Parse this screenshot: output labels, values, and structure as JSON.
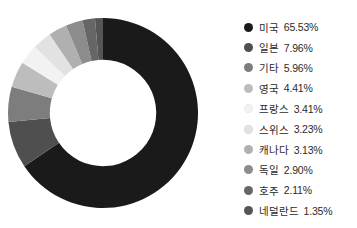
{
  "chart_data": {
    "type": "pie",
    "variant": "donut",
    "title": "",
    "xlabel": "",
    "ylabel": "",
    "legend_position": "right",
    "grid": false,
    "units": "%",
    "start_angle_deg": 0,
    "direction": "clockwise",
    "inner_radius_ratio": 0.56,
    "categories": [
      "미국",
      "일본",
      "기타",
      "영국",
      "프랑스",
      "스위스",
      "캐나다",
      "독일",
      "호주",
      "네덜란드"
    ],
    "values": [
      65.53,
      7.96,
      5.96,
      4.41,
      3.41,
      3.23,
      3.13,
      2.9,
      2.11,
      1.35
    ],
    "value_labels": [
      "65.53%",
      "7.96%",
      "5.96%",
      "4.41%",
      "3.41%",
      "3.23%",
      "3.13%",
      "2.90%",
      "2.11%",
      "1.35%"
    ],
    "colors": [
      "#1a1a1a",
      "#4f4f4f",
      "#7d7d7d",
      "#bdbdbd",
      "#f2f2f2",
      "#e2e2e2",
      "#b0b0b0",
      "#8c8c8c",
      "#666666",
      "#555555"
    ]
  },
  "legend": {
    "items": [
      {
        "label": "미국",
        "value": "65.53%",
        "color": "#1a1a1a"
      },
      {
        "label": "일본",
        "value": "7.96%",
        "color": "#4f4f4f"
      },
      {
        "label": "기타",
        "value": "5.96%",
        "color": "#7d7d7d"
      },
      {
        "label": "영국",
        "value": "4.41%",
        "color": "#bdbdbd"
      },
      {
        "label": "프랑스",
        "value": "3.41%",
        "color": "#f2f2f2"
      },
      {
        "label": "스위스",
        "value": "3.23%",
        "color": "#e2e2e2"
      },
      {
        "label": "캐나다",
        "value": "3.13%",
        "color": "#b0b0b0"
      },
      {
        "label": "독일",
        "value": "2.90%",
        "color": "#8c8c8c"
      },
      {
        "label": "호주",
        "value": "2.11%",
        "color": "#666666"
      },
      {
        "label": "네덜란드",
        "value": "1.35%",
        "color": "#555555"
      }
    ]
  }
}
